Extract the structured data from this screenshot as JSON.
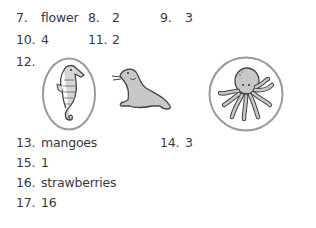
{
  "answers": [
    {
      "num": "7.",
      "answer": "flower"
    },
    {
      "num": "8.",
      "answer": "2"
    },
    {
      "num": "9.",
      "answer": "3"
    },
    {
      "num": "10.",
      "answer": "4"
    },
    {
      "num": "11.",
      "answer": "2"
    },
    {
      "num": "12.",
      "answer": "",
      "images": [
        {
          "name": "seahorse",
          "circled": true,
          "frame": "oval"
        },
        {
          "name": "seal",
          "circled": false
        },
        {
          "name": "octopus",
          "circled": true,
          "frame": "circle"
        }
      ]
    },
    {
      "num": "13.",
      "answer": "mangoes"
    },
    {
      "num": "14.",
      "answer": "3"
    },
    {
      "num": "15.",
      "answer": "1"
    },
    {
      "num": "16.",
      "answer": "strawberries"
    },
    {
      "num": "17.",
      "answer": "16"
    }
  ],
  "colors": {
    "text": "#3a3a3a",
    "ring": "#9a9a9a",
    "animal_fill": "#c8c8c8",
    "outline": "#444444"
  }
}
